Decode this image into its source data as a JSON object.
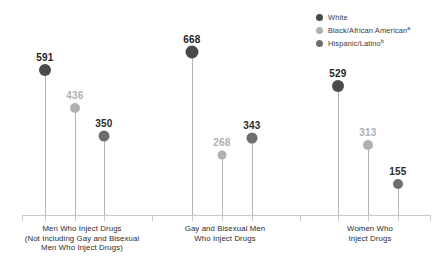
{
  "chart_data": {
    "type": "bar",
    "subtype": "lollipop",
    "title": "",
    "xlabel": "",
    "ylabel": "",
    "ylim": [
      0,
      700
    ],
    "grid": false,
    "legend_position": "top-right",
    "categories": [
      "Men Who Inject Drugs (Not Including Gay and Bisexual Men Who Inject Drugs)",
      "Gay and Bisexual Men Who Inject Drugs",
      "Women Who Inject Drugs"
    ],
    "series": [
      {
        "name": "White",
        "color": "#4a4a4a",
        "values": [
          591,
          668,
          529
        ]
      },
      {
        "name": "Black/African American",
        "color": "#b0b0b0",
        "values": [
          436,
          268,
          313
        ]
      },
      {
        "name": "Hispanic/Latino",
        "color": "#6e6e6e",
        "values": [
          350,
          343,
          155
        ]
      }
    ]
  },
  "legend": {
    "items": [
      {
        "label": "White",
        "sup": "",
        "color": "#4a4a4a"
      },
      {
        "label": "Black/African American",
        "sup": "a",
        "color": "#b0b0b0"
      },
      {
        "label": "Hispanic/Latino",
        "sup": "b",
        "color": "#6e6e6e"
      }
    ]
  },
  "categories": [
    {
      "lines": [
        "Men Who Inject Drugs",
        "(Not Including Gay and Bisexual",
        "Men Who Inject Drugs)"
      ],
      "center_x": 82
    },
    {
      "lines": [
        "Gay and Bisexual Men",
        "Who Inject Drugs"
      ],
      "center_x": 225
    },
    {
      "lines": [
        "Women Who",
        "Inject Drugs"
      ],
      "center_x": 370
    }
  ],
  "points": [
    {
      "group": 0,
      "series": "White",
      "value": "591",
      "x": 45,
      "dot_y": 70,
      "label_y": 52,
      "color": "#4a4a4a",
      "label_color": "#1f1f1f",
      "r": 6
    },
    {
      "group": 0,
      "series": "Black/African American",
      "value": "436",
      "x": 75,
      "dot_y": 108,
      "label_y": 90,
      "color": "#b0b0b0",
      "label_color": "#b0b0b0",
      "r": 5
    },
    {
      "group": 0,
      "series": "Hispanic/Latino",
      "value": "350",
      "x": 104,
      "dot_y": 136,
      "label_y": 118,
      "color": "#6e6e6e",
      "label_color": "#2b2b2b",
      "r": 5.5
    },
    {
      "group": 1,
      "series": "White",
      "value": "668",
      "x": 192,
      "dot_y": 52,
      "label_y": 34,
      "color": "#4a4a4a",
      "label_color": "#1f1f1f",
      "r": 6.5
    },
    {
      "group": 1,
      "series": "Black/African American",
      "value": "268",
      "x": 222,
      "dot_y": 155,
      "label_y": 137,
      "color": "#b0b0b0",
      "label_color": "#b0b0b0",
      "r": 4.5
    },
    {
      "group": 1,
      "series": "Hispanic/Latino",
      "value": "343",
      "x": 252,
      "dot_y": 138,
      "label_y": 120,
      "color": "#6e6e6e",
      "label_color": "#2b2b2b",
      "r": 5.5
    },
    {
      "group": 2,
      "series": "White",
      "value": "529",
      "x": 338,
      "dot_y": 86,
      "label_y": 68,
      "color": "#4a4a4a",
      "label_color": "#1f1f1f",
      "r": 6
    },
    {
      "group": 2,
      "series": "Black/African American",
      "value": "313",
      "x": 368,
      "dot_y": 145,
      "label_y": 127,
      "color": "#b0b0b0",
      "label_color": "#b0b0b0",
      "r": 5
    },
    {
      "group": 2,
      "series": "Hispanic/Latino",
      "value": "155",
      "x": 398,
      "dot_y": 184,
      "label_y": 166,
      "color": "#6e6e6e",
      "label_color": "#2b2b2b",
      "r": 5
    }
  ],
  "axis": {
    "baseline_y": 215,
    "ticks_x": [
      22,
      45,
      75,
      104,
      152,
      192,
      222,
      252,
      300,
      338,
      368,
      398,
      430
    ]
  },
  "footnote": {
    "text": ""
  }
}
